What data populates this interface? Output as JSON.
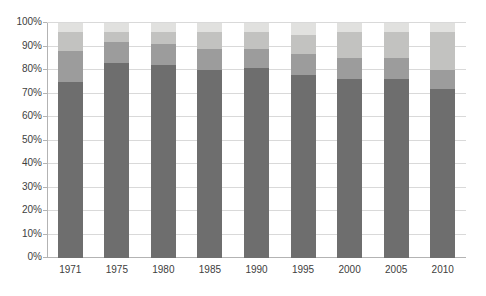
{
  "chart_data": {
    "type": "bar",
    "subtype": "stacked-100-percent",
    "title": "",
    "xlabel": "",
    "ylabel": "",
    "categories": [
      "1971",
      "1975",
      "1980",
      "1985",
      "1990",
      "1995",
      "2000",
      "2005",
      "2010"
    ],
    "series": [
      {
        "name": "segment-dark",
        "color": "#6e6e6e",
        "values": [
          75,
          83,
          82,
          80,
          81,
          78,
          76,
          76,
          72
        ]
      },
      {
        "name": "segment-medium",
        "color": "#9c9c9c",
        "values": [
          13,
          9,
          9,
          9,
          8,
          9,
          9,
          9,
          8
        ]
      },
      {
        "name": "segment-light",
        "color": "#c2c2c0",
        "values": [
          8,
          4,
          5,
          7,
          7,
          8,
          11,
          11,
          16
        ]
      },
      {
        "name": "segment-lightest",
        "color": "#e1e1df",
        "values": [
          4,
          4,
          4,
          4,
          4,
          5,
          4,
          4,
          4
        ]
      }
    ],
    "y_tick_labels": [
      "0%",
      "10%",
      "20%",
      "30%",
      "40%",
      "50%",
      "60%",
      "70%",
      "80%",
      "90%",
      "100%"
    ],
    "ylim": [
      0,
      100
    ],
    "grid": "horizontal",
    "legend": "none",
    "gridline_color": "#d9d9d9",
    "axis_color": "#b3b3b3",
    "label_color": "#404040",
    "background_color": "#ffffff"
  }
}
